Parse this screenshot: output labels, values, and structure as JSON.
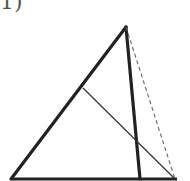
{
  "figure": {
    "label": "1)",
    "colors": {
      "stroke": "#222222",
      "dashed": "#666666"
    },
    "points": {
      "apex": [
        126,
        27
      ],
      "base_left": [
        11,
        179
      ],
      "base_right": [
        177,
        179
      ],
      "altitude_foot": [
        140,
        179
      ],
      "dashed_end": [
        175,
        179
      ],
      "thin_start": [
        83,
        88
      ]
    },
    "segments": [
      {
        "name": "left-side",
        "style": "thick"
      },
      {
        "name": "base",
        "style": "thick"
      },
      {
        "name": "inner-thick",
        "style": "thick"
      },
      {
        "name": "right-dashed",
        "style": "dashed"
      },
      {
        "name": "thin-diagonal",
        "style": "thin"
      }
    ]
  }
}
